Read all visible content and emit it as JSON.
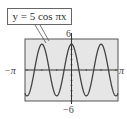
{
  "chart_data": {
    "type": "line",
    "title": "y = 5 cos πx",
    "function": "5*cos(pi*x)",
    "xlabel": "",
    "ylabel": "",
    "xlim": [
      -3.14159,
      3.14159
    ],
    "ylim": [
      -6,
      6
    ],
    "x_tick_labels": [
      "−π",
      "π"
    ],
    "y_tick_labels": [
      "6",
      "−6"
    ],
    "grid": false,
    "legend": null,
    "series": [
      {
        "name": "y = 5 cos πx",
        "x": [
          -3.14159,
          -3,
          -2.5,
          -2,
          -1.5,
          -1,
          -0.5,
          0,
          0.5,
          1,
          1.5,
          2,
          2.5,
          3,
          3.14159
        ],
        "values": [
          -4.51,
          -5,
          0,
          5,
          0,
          -5,
          0,
          5,
          0,
          -5,
          0,
          5,
          0,
          -5,
          -4.51
        ]
      }
    ],
    "annotations": [
      {
        "text": "y = 5 cos πx",
        "points_to": "curve near first peak (x = -2)"
      }
    ]
  },
  "labels": {
    "equation": "y = 5 cos πx",
    "y_max": "6",
    "y_min": "−6",
    "x_min": "−π",
    "x_max": "π"
  },
  "colors": {
    "screen_bg": "#e6e6e6",
    "screen_border": "#555555",
    "curve": "#444444",
    "axes": "#333333"
  }
}
